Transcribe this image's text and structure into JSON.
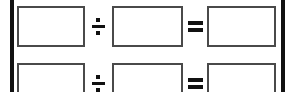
{
  "page": {
    "kind": "math-worksheet-fragment",
    "background_color": "#ffffff",
    "rule_color": "#111111",
    "box_border_color": "#4a4a4a"
  },
  "borders": {
    "left_rule_label": "left-vertical-rule",
    "right_rule_label": "right-vertical-rule"
  },
  "symbols": {
    "divide": "÷",
    "equals": "="
  },
  "rows": [
    {
      "index": 1,
      "operand_1": "",
      "operator_1": "÷",
      "operand_2": "",
      "operator_2": "=",
      "result": ""
    },
    {
      "index": 2,
      "operand_1": "",
      "operator_1": "÷",
      "operand_2": "",
      "operator_2": "=",
      "result": ""
    }
  ]
}
